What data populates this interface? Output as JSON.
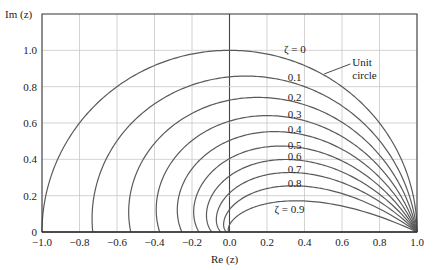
{
  "chart_data": {
    "type": "line",
    "title": "",
    "xlabel": "Re (z)",
    "ylabel": "Im (z)",
    "xlim": [
      -1.0,
      1.0
    ],
    "ylim": [
      0,
      1.2
    ],
    "grid": true,
    "xticks": [
      -1.0,
      -0.8,
      -0.6,
      -0.4,
      -0.2,
      0.0,
      0.2,
      0.4,
      0.6,
      0.8,
      1.0
    ],
    "xtick_labels": [
      "−1.0",
      "−0.8",
      "−0.6",
      "−0.4",
      "−0.2",
      "0.0",
      "0.2",
      "0.4",
      "0.6",
      "0.8",
      "1.0"
    ],
    "yticks": [
      0,
      0.2,
      0.4,
      0.6,
      0.8,
      1.0
    ],
    "ytick_labels": [
      "0",
      "0.2",
      "0.4",
      "0.6",
      "0.8",
      "1.0"
    ],
    "series": [
      {
        "name": "ζ = 0",
        "zeta": 0.0,
        "label": "ζ = 0",
        "label_pos": [
          0.29,
          1.01
        ]
      },
      {
        "name": "0.1",
        "zeta": 0.1,
        "label": "0.1",
        "label_pos": [
          0.31,
          0.855
        ]
      },
      {
        "name": "0.2",
        "zeta": 0.2,
        "label": "0.2",
        "label_pos": [
          0.31,
          0.745
        ]
      },
      {
        "name": "0.3",
        "zeta": 0.3,
        "label": "0.3",
        "label_pos": [
          0.31,
          0.65
        ]
      },
      {
        "name": "0.4",
        "zeta": 0.4,
        "label": "0.4",
        "label_pos": [
          0.31,
          0.565
        ]
      },
      {
        "name": "0.5",
        "zeta": 0.5,
        "label": "0.5",
        "label_pos": [
          0.31,
          0.478
        ]
      },
      {
        "name": "0.6",
        "zeta": 0.6,
        "label": "0.6",
        "label_pos": [
          0.31,
          0.418
        ]
      },
      {
        "name": "0.7",
        "zeta": 0.7,
        "label": "0.7",
        "label_pos": [
          0.31,
          0.345
        ]
      },
      {
        "name": "0.8",
        "zeta": 0.8,
        "label": "0.8",
        "label_pos": [
          0.31,
          0.268
        ]
      },
      {
        "name": "ζ = 0.9",
        "zeta": 0.9,
        "label": "ζ = 0.9",
        "label_pos": [
          0.24,
          0.125
        ]
      }
    ],
    "annotations": [
      {
        "text": "Unit",
        "pos": [
          0.655,
          0.935
        ]
      },
      {
        "text": "circle",
        "pos": [
          0.655,
          0.865
        ]
      }
    ],
    "leader_line": {
      "from": [
        0.505,
        0.87
      ],
      "to": [
        0.645,
        0.925
      ]
    }
  },
  "colors": {
    "curve": "#5a5a5a",
    "grid": "#c8c8c8",
    "axis": "#333333",
    "zero_axis": "#444444"
  }
}
